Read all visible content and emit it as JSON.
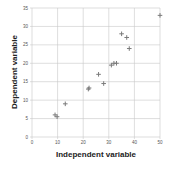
{
  "chart_data": {
    "type": "scatter",
    "title": "",
    "xlabel": "Independent variable",
    "ylabel": "Dependent variable",
    "xlim": [
      0,
      50
    ],
    "ylim": [
      0,
      35
    ],
    "xticks": [
      0,
      10,
      20,
      30,
      40,
      50
    ],
    "yticks": [
      0,
      5,
      10,
      15,
      20,
      25,
      30,
      35
    ],
    "grid": true,
    "legend": null,
    "marker": "plus",
    "marker_color": "#7a7a7a",
    "grid_color": "#c8c8c8",
    "series": [
      {
        "name": "data",
        "points": [
          {
            "x": 9,
            "y": 6
          },
          {
            "x": 9.8,
            "y": 5.5
          },
          {
            "x": 13,
            "y": 9
          },
          {
            "x": 22,
            "y": 13
          },
          {
            "x": 22.3,
            "y": 13.3
          },
          {
            "x": 26,
            "y": 17
          },
          {
            "x": 28,
            "y": 14.5
          },
          {
            "x": 31,
            "y": 19.5
          },
          {
            "x": 32,
            "y": 20
          },
          {
            "x": 33,
            "y": 20
          },
          {
            "x": 35,
            "y": 28
          },
          {
            "x": 37,
            "y": 27
          },
          {
            "x": 38,
            "y": 24
          },
          {
            "x": 50,
            "y": 33
          }
        ]
      }
    ]
  }
}
